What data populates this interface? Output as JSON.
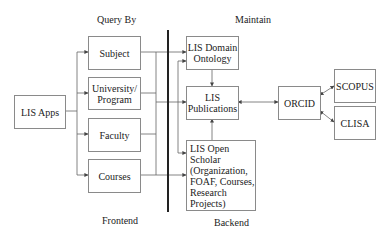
{
  "diagram": {
    "section_labels": {
      "query_by": "Query By",
      "maintain": "Maintain",
      "frontend": "Frontend",
      "backend": "Backend"
    },
    "nodes": {
      "lis_apps": "LIS Apps",
      "subject": "Subject",
      "university_program": "University/\nProgram",
      "faculty": "Faculty",
      "courses": "Courses",
      "lis_domain_ontology": "LIS Domain\nOntology",
      "lis_publications": "LIS\nPublications",
      "lis_open_scholar": "LIS Open Scholar\n(Organization,\nFOAF, Courses,\nResearch Projects)",
      "orcid": "ORCID",
      "scopus": "SCOPUS",
      "clisa": "CLISA"
    },
    "edges": [
      {
        "from": "LIS Apps",
        "to": "Subject"
      },
      {
        "from": "LIS Apps",
        "to": "University/Program"
      },
      {
        "from": "LIS Apps",
        "to": "Faculty"
      },
      {
        "from": "LIS Apps",
        "to": "Courses"
      },
      {
        "from": "Frontend bus",
        "to": "LIS Domain Ontology"
      },
      {
        "from": "Frontend bus",
        "to": "LIS Publications"
      },
      {
        "from": "Frontend bus",
        "to": "LIS Open Scholar"
      },
      {
        "from": "LIS Domain Ontology",
        "to": "LIS Publications"
      },
      {
        "from": "LIS Open Scholar",
        "to": "LIS Publications"
      },
      {
        "from": "LIS Publications",
        "to": "ORCID",
        "bidirectional": true
      },
      {
        "from": "ORCID",
        "to": "SCOPUS",
        "bidirectional": true
      },
      {
        "from": "ORCID",
        "to": "CLISA",
        "bidirectional": true
      }
    ]
  }
}
